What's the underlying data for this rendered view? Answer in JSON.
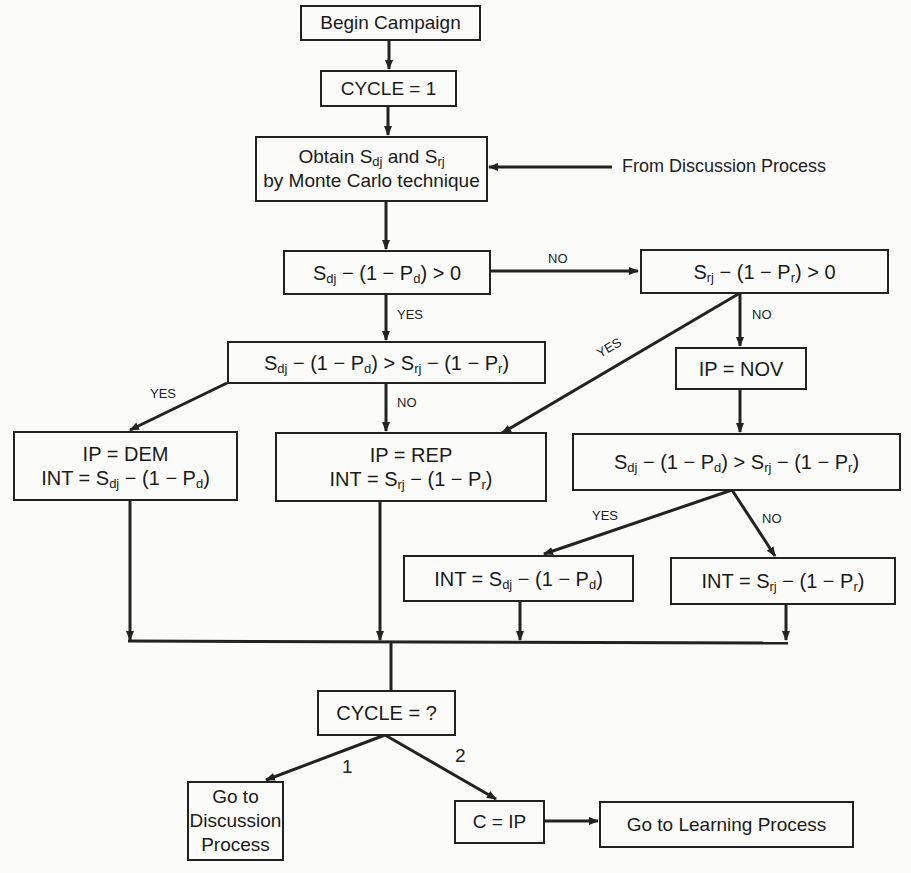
{
  "boxes": {
    "begin": "Begin Campaign",
    "cycle_init": "CYCLE = 1",
    "obtain_line1_a": "Obtain S",
    "obtain_line1_sub1": "dj",
    "obtain_line1_b": " and S",
    "obtain_line1_sub2": "rj",
    "obtain_line2": "by Monte Carlo technique",
    "cond_dem_pos": {
      "s": "S",
      "s_sub": "dj",
      "rest": " − (1 − P",
      "p_sub": "d",
      "tail": ") > 0"
    },
    "cond_rep_pos": {
      "s": "S",
      "s_sub": "rj",
      "rest": " − (1 − P",
      "p_sub": "r",
      "tail": ") > 0"
    },
    "cond_compare_left": {
      "s1": "S",
      "s1_sub": "dj",
      "m1": " − (1 − P",
      "p1_sub": "d",
      "gt": ") > S",
      "s2_sub": "rj",
      "m2": " − (1 − P",
      "p2_sub": "r",
      "tail": ")"
    },
    "nov": "IP = NOV",
    "cond_compare_right": {
      "s1": "S",
      "s1_sub": "dj",
      "m1": " − (1 − P",
      "p1_sub": "d",
      "gt": ") > S",
      "s2_sub": "rj",
      "m2": " − (1 − P",
      "p2_sub": "r",
      "tail": ")"
    },
    "dem": {
      "line1": "IP = DEM",
      "int": "INT = S",
      "s_sub": "dj",
      "rest": " − (1 − P",
      "p_sub": "d",
      "tail": ")"
    },
    "rep": {
      "line1": "IP = REP",
      "int": "INT = S",
      "s_sub": "rj",
      "rest": " − (1 − P",
      "p_sub": "r",
      "tail": ")"
    },
    "int_d": {
      "int": "INT = S",
      "s_sub": "dj",
      "rest": " − (1 − P",
      "p_sub": "d",
      "tail": ")"
    },
    "int_r": {
      "int": "INT = S",
      "s_sub": "rj",
      "rest": " − (1 − P",
      "p_sub": "r",
      "tail": ")"
    },
    "cycle_check": "CYCLE = ?",
    "goto_discussion": [
      "Go to",
      "Discussion",
      "Process"
    ],
    "c_ip": "C = IP",
    "goto_learning": "Go to Learning Process"
  },
  "side_input": "From Discussion Process",
  "edge_labels": {
    "no_1": "NO",
    "yes_1": "YES",
    "no_2": "NO",
    "yes_2": "YES",
    "yes_3": "YES",
    "no_3": "NO",
    "yes_4": "YES",
    "no_4": "NO",
    "branch_1": "1",
    "branch_2": "2"
  }
}
